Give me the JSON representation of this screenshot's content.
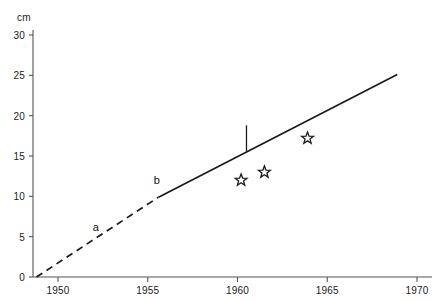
{
  "chart_data": {
    "type": "line",
    "title": "",
    "xlabel": "",
    "ylabel": "",
    "yunit": "cm",
    "xlim": [
      1948,
      1970.6
    ],
    "ylim": [
      0,
      31.5
    ],
    "grid": false,
    "legend": "none",
    "x_ticks": [
      1950,
      1955,
      1960,
      1965,
      1970
    ],
    "x_tick_labels": [
      "1950",
      "1955",
      "1960",
      "1965",
      "1970"
    ],
    "y_ticks": [
      0,
      5,
      10,
      15,
      20,
      25,
      30
    ],
    "y_tick_labels": [
      "0",
      "5",
      "10",
      "15",
      "20",
      "25",
      "30"
    ],
    "series": [
      {
        "name": "a",
        "style": "dashed",
        "label": "a",
        "label_at": {
          "x": 1952.1,
          "y": 6.2
        },
        "points": [
          {
            "x": 1948.8,
            "y": 0.0
          },
          {
            "x": 1955.6,
            "y": 9.9
          }
        ]
      },
      {
        "name": "b",
        "style": "solid",
        "label": "b",
        "label_at": {
          "x": 1955.5,
          "y": 12.0
        },
        "points": [
          {
            "x": 1955.6,
            "y": 9.9
          },
          {
            "x": 1968.9,
            "y": 25.1
          }
        ]
      },
      {
        "name": "observations",
        "style": "star-markers",
        "points": [
          {
            "x": 1960.2,
            "y": 12.0
          },
          {
            "x": 1961.5,
            "y": 13.0
          },
          {
            "x": 1963.9,
            "y": 17.2
          }
        ]
      }
    ],
    "annotations": [
      {
        "name": "cross-tick",
        "type": "vertical-tick",
        "x": 1960.5,
        "y": 17.2,
        "half_length_units": 1.6
      }
    ],
    "colors": {
      "line": "#1a1a1a",
      "axis": "#555555",
      "text": "#1a1a1a",
      "marker": "#1a1a1a",
      "background": "#ffffff"
    }
  }
}
